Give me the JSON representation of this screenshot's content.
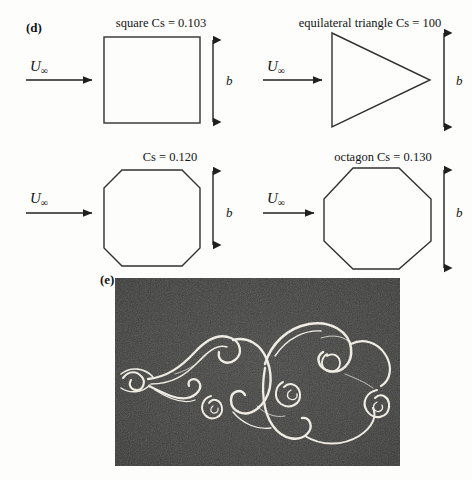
{
  "figure": {
    "panels": [
      {
        "label": "(d)",
        "shapes": [
          {
            "name": "square",
            "caption": "square Cs = 0.103",
            "shape_type": "square",
            "flow_label_u": "U",
            "flow_label_sub": "∞",
            "dimension_label": "b"
          },
          {
            "name": "equilateral-triangle",
            "caption": "equilateral triangle Cs = 100",
            "shape_type": "triangle",
            "flow_label_u": "U",
            "flow_label_sub": "∞",
            "dimension_label": "b"
          },
          {
            "name": "chamfered-square",
            "caption": "Cs = 0.120",
            "shape_type": "chamfered-square",
            "flow_label_u": "U",
            "flow_label_sub": "∞",
            "dimension_label": "b"
          },
          {
            "name": "octagon",
            "caption": "octagon Cs = 0.130",
            "shape_type": "octagon",
            "flow_label_u": "U",
            "flow_label_sub": "∞",
            "dimension_label": "b"
          }
        ]
      },
      {
        "label": "(e)",
        "photo": {
          "name": "von-karman-vortex-street-photograph",
          "description": "flow visualization photograph of a von Karman vortex street"
        }
      }
    ]
  },
  "colors": {
    "page_background": "#fdfdfc",
    "ink": "#141414",
    "shape_outline": "#303030",
    "photo_background": "#3a3a3a",
    "streak_light": "#f2f0ea"
  }
}
